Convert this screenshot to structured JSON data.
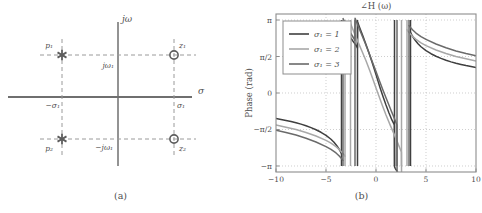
{
  "figure": {
    "subfigures": [
      {
        "caption": "(a)",
        "kind": "pole-zero-plot"
      },
      {
        "caption": "(b)",
        "kind": "phase-plot"
      }
    ]
  },
  "pole_zero": {
    "axis_labels": {
      "real": "σ",
      "imag": "jω"
    },
    "tick_labels": {
      "sigma_pos": "σ₁",
      "sigma_neg": "−σ₁",
      "omega_pos": "jω₁",
      "omega_neg": "−jω₁"
    },
    "markers": [
      {
        "name": "p₁",
        "type": "pole",
        "glyph": "asterisk",
        "re": -1,
        "im": 1
      },
      {
        "name": "p₂",
        "type": "pole",
        "glyph": "asterisk",
        "re": -1,
        "im": -1
      },
      {
        "name": "z₁",
        "type": "zero",
        "glyph": "circle",
        "re": 1,
        "im": 1
      },
      {
        "name": "z₂",
        "type": "zero",
        "glyph": "circle",
        "re": 1,
        "im": -1
      }
    ]
  },
  "chart_data": {
    "type": "line",
    "title": "∠H (ω)",
    "xlabel": "ω (rad/s)",
    "ylabel": "Phase (rad)",
    "xlim": [
      -10,
      10
    ],
    "ylim": [
      -3.4,
      3.4
    ],
    "xticks": [
      -10,
      -5,
      0,
      5,
      10
    ],
    "xticklabels": [
      "−10",
      "−5",
      "0",
      "5",
      "10"
    ],
    "yticks": [
      3.14159,
      1.5708,
      0,
      -1.5708,
      -3.14159
    ],
    "yticklabels": [
      "π",
      "π/2",
      "0",
      "−π/2",
      "−π"
    ],
    "grid": true,
    "grid_style": "dotted",
    "legend_position": "top-left",
    "legend": [
      {
        "label": "σ₁ = 1",
        "color": "#3f3f3f"
      },
      {
        "label": "σ₁ = 2",
        "color": "#a8a8a8"
      },
      {
        "label": "σ₁ = 3",
        "color": "#6a6a6a"
      }
    ],
    "series": [
      {
        "name": "σ₁ = 1",
        "color": "#3f3f3f",
        "sigma1": 1,
        "omega1": 3.2,
        "branch_edges": [
          -3.45,
          -1.85,
          1.85,
          3.45
        ],
        "x": [
          -10,
          -9.5,
          -9,
          -8.5,
          -8,
          -7.5,
          -7,
          -6.5,
          -6,
          -5.5,
          -5,
          -4.5,
          -4.2,
          -3.9,
          -3.7,
          -3.55,
          -3.46,
          -3.44,
          -3.2,
          -3,
          -2.8,
          -2.6,
          -2.4,
          -2.2,
          -2.05,
          -1.92,
          -1.86,
          -1.84,
          -1.6,
          -1.3,
          -1,
          -0.7,
          -0.4,
          -0.2,
          0,
          0.2,
          0.4,
          0.7,
          1,
          1.3,
          1.6,
          1.84,
          1.86,
          1.92,
          2.05,
          2.2,
          2.4,
          2.6,
          2.8,
          3,
          3.2,
          3.44,
          3.46,
          3.55,
          3.7,
          3.9,
          4.2,
          4.5,
          5,
          5.5,
          6,
          6.5,
          7,
          7.5,
          8,
          8.5,
          9,
          9.5,
          10
        ],
        "y": [
          -1.1,
          -1.14,
          -1.18,
          -1.23,
          -1.28,
          -1.34,
          -1.41,
          -1.49,
          -1.58,
          -1.69,
          -1.82,
          -1.99,
          -2.12,
          -2.28,
          -2.41,
          -2.52,
          -2.6,
          3.04,
          2.8,
          2.66,
          2.53,
          2.41,
          2.29,
          2.17,
          2.08,
          1.99,
          1.94,
          3.05,
          2.78,
          2.44,
          2.09,
          1.72,
          1.33,
          1.07,
          0.79,
          0.51,
          0.24,
          -0.15,
          -0.52,
          -0.86,
          -1.17,
          -1.37,
          -3.18,
          -3.24,
          -3.33,
          -3.43,
          -3.55,
          -3.67,
          -3.8,
          -3.94,
          -4.08,
          -4.33,
          2.6,
          2.52,
          2.41,
          2.28,
          2.12,
          1.99,
          1.82,
          1.69,
          1.58,
          1.49,
          1.41,
          1.34,
          1.28,
          1.23,
          1.18,
          1.14,
          1.1
        ]
      },
      {
        "name": "σ₁ = 2",
        "color": "#a8a8a8",
        "sigma1": 2,
        "omega1": 3.2,
        "branch_edges": [
          -3.1,
          -2.55,
          2.55,
          3.1
        ],
        "x": [
          -10,
          -9,
          -8,
          -7,
          -6,
          -5,
          -4.5,
          -4,
          -3.6,
          -3.3,
          -3.15,
          -3.11,
          -3.09,
          -2.95,
          -2.8,
          -2.68,
          -2.58,
          -2.56,
          -2.54,
          -2.2,
          -1.8,
          -1.4,
          -1,
          -0.6,
          -0.3,
          0,
          0.3,
          0.6,
          1,
          1.4,
          1.8,
          2.2,
          2.54,
          2.56,
          2.58,
          2.68,
          2.8,
          2.95,
          3.09,
          3.11,
          3.15,
          3.3,
          3.6,
          4,
          4.5,
          5,
          6,
          7,
          8,
          9,
          10
        ],
        "y": [
          -1.38,
          -1.47,
          -1.57,
          -1.7,
          -1.85,
          -2.04,
          -2.16,
          -2.31,
          -2.46,
          -2.6,
          -2.68,
          -2.72,
          2.98,
          2.83,
          2.7,
          2.61,
          2.54,
          2.53,
          2.98,
          2.62,
          2.2,
          1.8,
          1.39,
          0.94,
          0.58,
          0.22,
          -0.14,
          -0.5,
          -0.95,
          -1.36,
          -1.76,
          -2.18,
          -2.54,
          -3.75,
          -3.78,
          -3.87,
          -3.98,
          -4.11,
          -4.24,
          2.72,
          2.68,
          2.6,
          2.46,
          2.31,
          2.16,
          2.04,
          1.85,
          1.7,
          1.57,
          1.47,
          1.38
        ]
      },
      {
        "name": "σ₁ = 3",
        "color": "#6a6a6a",
        "sigma1": 3,
        "omega1": 3.2,
        "branch_edges": [
          -3.3,
          -2.1,
          2.1,
          3.3
        ],
        "x": [
          -10,
          -9,
          -8,
          -7,
          -6,
          -5,
          -4.5,
          -4,
          -3.7,
          -3.45,
          -3.33,
          -3.31,
          -3.29,
          -3.1,
          -2.9,
          -2.7,
          -2.5,
          -2.3,
          -2.15,
          -2.11,
          -2.09,
          -1.8,
          -1.5,
          -1.1,
          -0.7,
          -0.35,
          0,
          0.35,
          0.7,
          1.1,
          1.5,
          1.8,
          2.09,
          2.11,
          2.15,
          2.3,
          2.5,
          2.7,
          2.9,
          3.1,
          3.29,
          3.31,
          3.33,
          3.45,
          3.7,
          4,
          4.5,
          5,
          6,
          7,
          8,
          9,
          10
        ],
        "y": [
          -1.6,
          -1.7,
          -1.81,
          -1.95,
          -2.11,
          -2.31,
          -2.43,
          -2.58,
          -2.7,
          -2.82,
          -2.89,
          -2.9,
          3.2,
          3.02,
          2.85,
          2.7,
          2.55,
          2.41,
          2.3,
          2.27,
          3.22,
          2.9,
          2.58,
          2.16,
          1.72,
          1.32,
          0.92,
          0.52,
          0.12,
          -0.31,
          -0.74,
          -1.05,
          -1.38,
          -4.01,
          -4.04,
          -4.14,
          -4.28,
          -4.43,
          -4.57,
          -4.73,
          -4.92,
          2.9,
          2.89,
          2.82,
          2.7,
          2.58,
          2.43,
          2.31,
          2.11,
          1.95,
          1.81,
          1.7,
          1.6
        ]
      }
    ]
  }
}
